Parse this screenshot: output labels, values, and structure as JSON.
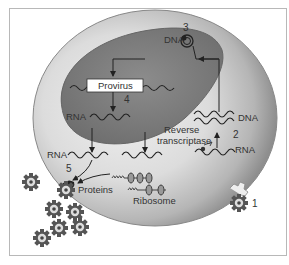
{
  "diagram": {
    "labels": {
      "provirus": "Provirus",
      "dna_nucleus": "DNA",
      "dna_cytoplasm": "DNA",
      "rna_nucleus": "RNA",
      "rna_cytoplasm": "RNA",
      "rna_viral": "RNA",
      "reverse": "Reverse",
      "transcriptase": "transcriptase",
      "proteins": "Proteins",
      "ribosome": "Ribosome"
    },
    "steps": [
      "1",
      "2",
      "3",
      "4",
      "5"
    ],
    "colors": {
      "cell_light": "#e6e6e6",
      "cell_dark": "#8a8a8a",
      "nucleus": "#7d7d7d",
      "nucleus_edge": "#6a6a6a",
      "line": "#333333",
      "frame": "#b8b8b8"
    },
    "icons": [
      "virus-particle-icon",
      "ribosome-icon",
      "arrow-icon",
      "circular-dna-icon",
      "reverse-transcriptase-icon"
    ]
  }
}
